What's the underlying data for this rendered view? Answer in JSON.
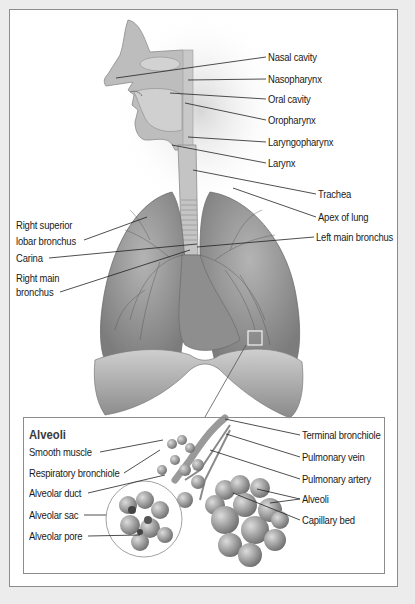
{
  "diagram": {
    "upper_labels_right": [
      {
        "id": "nasal-cavity",
        "text": "Nasal cavity"
      },
      {
        "id": "nasopharynx",
        "text": "Nasopharynx"
      },
      {
        "id": "oral-cavity",
        "text": "Oral cavity"
      },
      {
        "id": "oropharynx",
        "text": "Oropharynx"
      },
      {
        "id": "laryngopharynx",
        "text": "Laryngopharynx"
      },
      {
        "id": "larynx",
        "text": "Larynx"
      },
      {
        "id": "trachea",
        "text": "Trachea"
      },
      {
        "id": "apex-of-lung",
        "text": "Apex of lung"
      },
      {
        "id": "left-main-bronchus",
        "text": "Left main bronchus"
      }
    ],
    "upper_labels_left": [
      {
        "id": "right-superior-lobar-bronchus",
        "line1": "Right superior",
        "line2": "lobar bronchus"
      },
      {
        "id": "carina",
        "line1": "Carina"
      },
      {
        "id": "right-main-bronchus",
        "line1": "Right main",
        "line2": "bronchus"
      }
    ],
    "inset": {
      "title": "Alveoli",
      "labels_left": [
        {
          "id": "smooth-muscle",
          "text": "Smooth muscle"
        },
        {
          "id": "respiratory-bronchiole",
          "text": "Respiratory bronchiole"
        },
        {
          "id": "alveolar-duct",
          "text": "Alveolar duct"
        },
        {
          "id": "alveolar-sac",
          "text": "Alveolar sac"
        },
        {
          "id": "alveolar-pore",
          "text": "Alveolar pore"
        }
      ],
      "labels_right": [
        {
          "id": "terminal-bronchiole",
          "text": "Terminal bronchiole"
        },
        {
          "id": "pulmonary-vein",
          "text": "Pulmonary vein"
        },
        {
          "id": "pulmonary-artery",
          "text": "Pulmonary artery"
        },
        {
          "id": "alveoli",
          "text": "Alveoli"
        },
        {
          "id": "capillary-bed",
          "text": "Capillary bed"
        }
      ]
    }
  }
}
